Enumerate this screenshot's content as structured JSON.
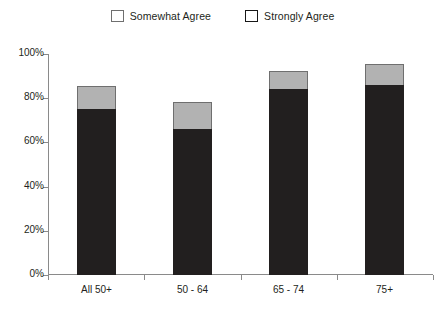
{
  "legend": {
    "position": "top-center",
    "entries": [
      {
        "label": "Somewhat Agree",
        "color": "#b2b2b2",
        "swatch_name": "legend-swatch-somewhat-agree"
      },
      {
        "label": "Strongly Agree",
        "color": "#221f1f",
        "swatch_name": "legend-swatch-strongly-agree"
      }
    ]
  },
  "axes": {
    "y_ticks": [
      "0%",
      "20%",
      "40%",
      "60%",
      "80%",
      "100%"
    ],
    "y_tick_values": [
      0,
      20,
      40,
      60,
      80,
      100
    ],
    "x_labels": [
      "All 50+",
      "50 - 64",
      "65 - 74",
      "75+"
    ]
  },
  "chart_data": {
    "type": "bar",
    "stacked": true,
    "title": "",
    "subtitle": "",
    "xlabel": "",
    "ylabel": "",
    "ylim": [
      0,
      100
    ],
    "y_tick_format": "percent",
    "grid": false,
    "legend_position": "top-center",
    "categories": [
      "All 50+",
      "50 - 64",
      "65 - 74",
      "75+"
    ],
    "series": [
      {
        "name": "Strongly Agree",
        "color": "#221f1f",
        "values": [
          75,
          66,
          84,
          86
        ]
      },
      {
        "name": "Somewhat Agree",
        "color": "#b2b2b2",
        "values": [
          10,
          12,
          8,
          9
        ]
      }
    ],
    "totals": [
      85,
      78,
      92,
      95
    ]
  }
}
